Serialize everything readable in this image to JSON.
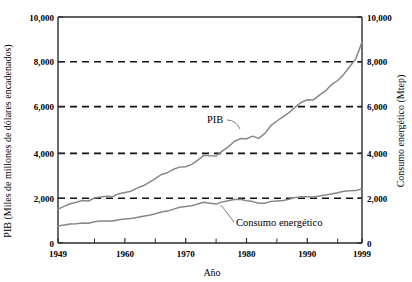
{
  "chart_data": {
    "type": "line",
    "title": "",
    "xlabel": "Año",
    "ylabel": "PIB (Miles de millones de dólares encadenados)",
    "y2label": "Consumo energético (Mtep)",
    "xlim": [
      1949,
      1999
    ],
    "ylim": [
      0,
      10000
    ],
    "y2lim": [
      0,
      10000
    ],
    "grid": "horizontal dashed at 2,000 / 4,000 / 6,000 / 8,000",
    "legend": "inline annotations on curves",
    "x_ticks": [
      1949,
      1960,
      1970,
      1980,
      1990,
      1999
    ],
    "x_tick_labels": [
      "1949",
      "1960",
      "1970",
      "1980",
      "1990",
      "1999"
    ],
    "x_minor_ticks": [
      1955,
      1965,
      1975,
      1985,
      1995
    ],
    "y_ticks": [
      0,
      2000,
      4000,
      6000,
      8000,
      10000
    ],
    "y_tick_labels": [
      "0",
      "2,000",
      "4,000",
      "6,000",
      "8,000",
      "10,000"
    ],
    "y2_ticks": [
      0,
      2000,
      4000,
      6000,
      8000,
      10000
    ],
    "y2_tick_labels": [
      "0",
      "2,000",
      "4,000",
      "6,000",
      "8,000",
      "10,000"
    ],
    "series": [
      {
        "name": "PIB",
        "axis": "left",
        "units": "Miles de millones de dólares encadenados",
        "color": "#878787",
        "x": [
          1949,
          1950,
          1951,
          1952,
          1953,
          1954,
          1955,
          1956,
          1957,
          1958,
          1959,
          1960,
          1961,
          1962,
          1963,
          1964,
          1965,
          1966,
          1967,
          1968,
          1969,
          1970,
          1971,
          1972,
          1973,
          1974,
          1975,
          1976,
          1977,
          1978,
          1979,
          1980,
          1981,
          1982,
          1983,
          1984,
          1985,
          1986,
          1987,
          1988,
          1989,
          1990,
          1991,
          1992,
          1993,
          1994,
          1995,
          1996,
          1997,
          1998,
          1999
        ],
        "values": [
          1500,
          1620,
          1740,
          1800,
          1880,
          1860,
          1990,
          2030,
          2070,
          2050,
          2180,
          2230,
          2290,
          2430,
          2530,
          2680,
          2850,
          3030,
          3110,
          3260,
          3360,
          3370,
          3480,
          3670,
          3880,
          3860,
          3850,
          4060,
          4250,
          4490,
          4620,
          4610,
          4730,
          4630,
          4840,
          5190,
          5400,
          5580,
          5770,
          6010,
          6220,
          6340,
          6330,
          6540,
          6730,
          7010,
          7190,
          7470,
          7810,
          8160,
          8890
        ]
      },
      {
        "name": "Consumo energético",
        "axis": "right",
        "units": "Mtep",
        "color": "#878787",
        "x": [
          1949,
          1950,
          1951,
          1952,
          1953,
          1954,
          1955,
          1956,
          1957,
          1958,
          1959,
          1960,
          1961,
          1962,
          1963,
          1964,
          1965,
          1966,
          1967,
          1968,
          1969,
          1970,
          1971,
          1972,
          1973,
          1974,
          1975,
          1976,
          1977,
          1978,
          1979,
          1980,
          1981,
          1982,
          1983,
          1984,
          1985,
          1986,
          1987,
          1988,
          1989,
          1990,
          1991,
          1992,
          1993,
          1994,
          1995,
          1996,
          1997,
          1998,
          1999
        ],
        "values": [
          750,
          790,
          840,
          850,
          880,
          870,
          940,
          970,
          980,
          980,
          1030,
          1060,
          1080,
          1130,
          1180,
          1230,
          1290,
          1370,
          1410,
          1500,
          1580,
          1620,
          1650,
          1730,
          1800,
          1760,
          1720,
          1820,
          1870,
          1920,
          1940,
          1870,
          1830,
          1760,
          1760,
          1840,
          1860,
          1880,
          1940,
          2010,
          2050,
          2050,
          2040,
          2080,
          2130,
          2170,
          2220,
          2290,
          2310,
          2320,
          2400
        ]
      }
    ],
    "annotations": [
      {
        "text": "PIB",
        "x_label": 1978,
        "y_label": 6400
      },
      {
        "text": "Consumo energético",
        "x_label": 1984,
        "y_label": 1100
      }
    ]
  },
  "axes": {
    "left_title": "PIB (Miles de millones de dólares encadenados)",
    "right_title": "Consumo energético (Mtep)",
    "x_title": "Año"
  },
  "labels": {
    "y_10000": "10,000",
    "y_8000": "8,000",
    "y_6000": "6,000",
    "y_4000": "4,000",
    "y_2000": "2,000",
    "y_0": "0",
    "y2_10000": "10,000",
    "y2_8000": "8,000",
    "y2_6000": "6,000",
    "y2_4000": "4,000",
    "y2_2000": "2,000",
    "y2_0": "0",
    "x_1949": "1949",
    "x_1960": "1960",
    "x_1970": "1970",
    "x_1980": "1980",
    "x_1990": "1990",
    "x_1999": "1999",
    "series_pib": "PIB",
    "series_consumo": "Consumo energético"
  }
}
